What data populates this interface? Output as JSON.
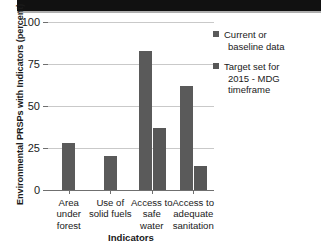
{
  "chart_data": {
    "type": "bar",
    "title": "",
    "xlabel": "Indicators",
    "ylabel": "Environmental PRSPs with Indicators (percent)",
    "categories": [
      "Area under forest",
      "Use of solid fuels",
      "Access to safe water",
      "Access to adequate sanitation"
    ],
    "category_lines": [
      [
        "Area",
        "under",
        "forest"
      ],
      [
        "Use of",
        "solid fuels"
      ],
      [
        "Access to",
        "safe",
        "water"
      ],
      [
        "Access to",
        "adequate",
        "sanitation"
      ]
    ],
    "series": [
      {
        "name": "Current or baseline data",
        "name_lines": [
          "Current or",
          "baseline data"
        ],
        "color": "#5a5a5a",
        "values": [
          28,
          20,
          83,
          62
        ]
      },
      {
        "name": "Target set for 2015 - MDG timeframe",
        "name_lines": [
          "Target set for",
          "2015 - MDG timeframe"
        ],
        "color": "#575757",
        "values": [
          null,
          null,
          37,
          14
        ]
      }
    ],
    "ylim": [
      0,
      100
    ],
    "yticks": [
      0,
      25,
      50,
      75,
      100
    ],
    "ytick_labels": [
      "0",
      "25",
      "50",
      "75",
      "100"
    ],
    "grid": true,
    "legend_position": "right"
  },
  "colors": {
    "bar": "#5a5a5a",
    "grid": "#c9c9c9",
    "axis": "#6f6f6f",
    "text": "#1a1a1a",
    "top_band": "#111111"
  }
}
